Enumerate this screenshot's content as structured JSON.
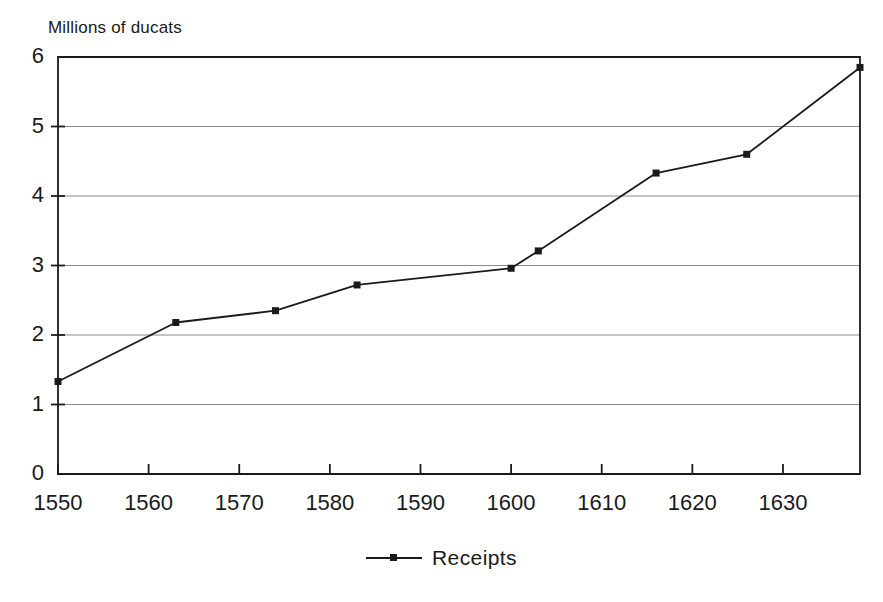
{
  "chart_data": {
    "type": "line",
    "title": "",
    "ylabel": "Millions of ducats",
    "xlabel": "",
    "ylim": [
      0,
      6
    ],
    "xlim": [
      1550,
      1638.5
    ],
    "grid": true,
    "y_ticks": [
      "0",
      "1",
      "2",
      "3",
      "4",
      "5",
      "6"
    ],
    "y_tick_values": [
      0,
      1,
      2,
      3,
      4,
      5,
      6
    ],
    "x_ticks": [
      "1550",
      "1560",
      "1570",
      "1580",
      "1590",
      "1600",
      "1610",
      "1620",
      "1630"
    ],
    "x_tick_values": [
      1550,
      1560,
      1570,
      1580,
      1590,
      1600,
      1610,
      1620,
      1630
    ],
    "legend_position": "bottom-center",
    "series": [
      {
        "name": "Receipts",
        "marker": "square",
        "color": "#1a1a1a",
        "x": [
          1550,
          1563,
          1574,
          1583,
          1600,
          1603,
          1616,
          1626,
          1638.5
        ],
        "values": [
          1.33,
          2.18,
          2.35,
          2.72,
          2.96,
          3.21,
          4.33,
          4.6,
          5.85
        ]
      }
    ]
  },
  "legend": {
    "entries": [
      {
        "label": "Receipts"
      }
    ]
  },
  "axis": {
    "y_title": "Millions of ducats"
  }
}
